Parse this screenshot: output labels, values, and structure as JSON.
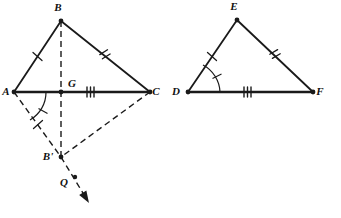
{
  "figure": {
    "stroke_color": "#1a1a1a",
    "background_color": "#ffffff"
  },
  "left_figure": {
    "name": "triangle-abc-with-reflection",
    "vertices": [
      {
        "id": "A",
        "label": "A",
        "x": 14,
        "y": 92,
        "label_x": 6,
        "label_y": 95
      },
      {
        "id": "B",
        "label": "B",
        "x": 61,
        "y": 21,
        "label_x": 58,
        "label_y": 11
      },
      {
        "id": "C",
        "label": "C",
        "x": 150,
        "y": 92,
        "label_x": 156,
        "label_y": 95
      },
      {
        "id": "G",
        "label": "G",
        "x": 61,
        "y": 92,
        "label_x": 72,
        "label_y": 87
      },
      {
        "id": "Bp",
        "label": "B'",
        "x": 61,
        "y": 157,
        "label_x": 48,
        "label_y": 160
      },
      {
        "id": "Q",
        "label": "Q",
        "x": 75,
        "y": 177,
        "label_x": 64,
        "label_y": 186
      }
    ],
    "solid_segments": [
      {
        "name": "segment-AB",
        "from": "A",
        "to": "B"
      },
      {
        "name": "segment-BC",
        "from": "B",
        "to": "C"
      },
      {
        "name": "segment-AC",
        "from": "A",
        "to": "C"
      }
    ],
    "dashed_segments": [
      {
        "name": "segment-B-to-Bprime",
        "from": "B",
        "to": "Bp"
      },
      {
        "name": "segment-A-to-Bprime",
        "from": "A",
        "to": "Bp"
      },
      {
        "name": "segment-C-to-Bprime",
        "from": "C",
        "to": "Bp"
      }
    ],
    "dashed_ray": {
      "name": "ray-Bprime-through-Q",
      "from": "Bp",
      "through": "Q",
      "arrow_tip_x": 89,
      "arrow_tip_y": 203
    },
    "tick_marks": [
      {
        "name": "tick-AB",
        "segment": "AB",
        "count": 1
      },
      {
        "name": "tick-BC",
        "segment": "BC",
        "count": 2
      },
      {
        "name": "tick-GC",
        "segment": "GC",
        "count": 3
      },
      {
        "name": "tick-ABprime",
        "segment": "AB'",
        "count": 1
      }
    ],
    "angle_marks": [
      {
        "name": "angle-A-between-AC-and-ABprime",
        "vertex": "A",
        "ticks": 1
      }
    ]
  },
  "right_figure": {
    "name": "triangle-def",
    "vertices": [
      {
        "id": "D",
        "label": "D",
        "x": 188,
        "y": 92,
        "label_x": 176,
        "label_y": 95
      },
      {
        "id": "E",
        "label": "E",
        "x": 237,
        "y": 20,
        "label_x": 234,
        "label_y": 10
      },
      {
        "id": "F",
        "label": "F",
        "x": 313,
        "y": 92,
        "label_x": 320,
        "label_y": 95
      }
    ],
    "solid_segments": [
      {
        "name": "segment-DE",
        "from": "D",
        "to": "E"
      },
      {
        "name": "segment-EF",
        "from": "E",
        "to": "F"
      },
      {
        "name": "segment-DF",
        "from": "D",
        "to": "F"
      }
    ],
    "tick_marks": [
      {
        "name": "tick-DE",
        "segment": "DE",
        "count": 1
      },
      {
        "name": "tick-EF",
        "segment": "EF",
        "count": 2
      },
      {
        "name": "tick-DF",
        "segment": "DF",
        "count": 3
      }
    ],
    "angle_marks": [
      {
        "name": "angle-D-between-DF-and-DE",
        "vertex": "D",
        "ticks": 1
      }
    ]
  }
}
